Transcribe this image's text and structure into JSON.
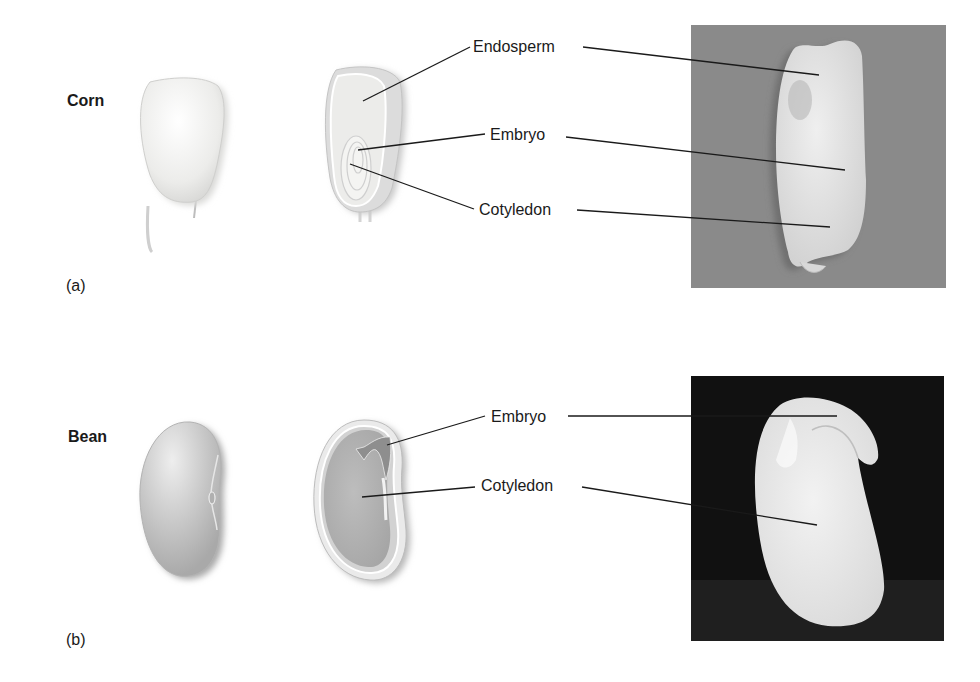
{
  "figure": {
    "panels": [
      {
        "id": "a",
        "panel_label": "(a)",
        "species": "Corn",
        "callouts": [
          {
            "label": "Endosperm"
          },
          {
            "label": "Embryo"
          },
          {
            "label": "Cotyledon"
          }
        ],
        "photo_background": "#8a8a8a"
      },
      {
        "id": "b",
        "panel_label": "(b)",
        "species": "Bean",
        "callouts": [
          {
            "label": "Embryo"
          },
          {
            "label": "Cotyledon"
          }
        ],
        "photo_background": "#111111"
      }
    ]
  },
  "colors": {
    "leader_line": "#1a1a1a",
    "corn_kernel": "#f2f2f0",
    "bean_seed": "#c9c9c9",
    "bean_cotyledon": "#b5b5b5",
    "bean_embryo": "#8e8e8e"
  }
}
